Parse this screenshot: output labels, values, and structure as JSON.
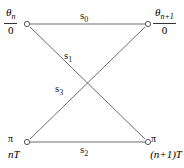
{
  "figure": {
    "type": "trellis-butterfly-diagram",
    "width": 184,
    "height": 168,
    "background_color": "#ffffff",
    "line_color": "#6e6e6e",
    "text_color": "#1a1a1a"
  },
  "nodes": [
    {
      "id": "top-left",
      "x": 27,
      "y": 24,
      "phase_symbol": "θ",
      "phase_subscript": "n",
      "denominator": "0",
      "style": "fraction"
    },
    {
      "id": "top-right",
      "x": 148,
      "y": 24,
      "phase_symbol": "θ",
      "phase_subscript": "n+1",
      "denominator": "0",
      "style": "fraction"
    },
    {
      "id": "bottom-left",
      "x": 27,
      "y": 142,
      "phase_symbol": "π",
      "time_label": "nT",
      "style": "plain"
    },
    {
      "id": "bottom-right",
      "x": 148,
      "y": 142,
      "phase_symbol": "π",
      "time_label": "(n+1)T",
      "style": "plain"
    }
  ],
  "edges": [
    {
      "id": "edge-s0",
      "label_base": "s",
      "label_subscript": "0",
      "from": "top-left",
      "to": "top-right",
      "label_x": 84,
      "label_y": 12
    },
    {
      "id": "edge-s1",
      "label_base": "s",
      "label_subscript": "1",
      "from": "top-left",
      "to": "bottom-right",
      "label_x": 68,
      "label_y": 53
    },
    {
      "id": "edge-s3",
      "label_base": "s",
      "label_subscript": "3",
      "from": "bottom-left",
      "to": "top-right",
      "label_x": 58,
      "label_y": 86
    },
    {
      "id": "edge-s2",
      "label_base": "s",
      "label_subscript": "2",
      "from": "bottom-left",
      "to": "bottom-right",
      "label_x": 84,
      "label_y": 146
    }
  ],
  "corner_labels": {
    "top_left": {
      "numerator_symbol": "θ",
      "numerator_subscript": "n",
      "denominator": "0"
    },
    "top_right": {
      "numerator_symbol": "θ",
      "numerator_subscript": "n+1",
      "denominator": "0"
    },
    "bottom_left": {
      "pi": "π",
      "time": "nT"
    },
    "bottom_right": {
      "pi": "π",
      "time": "(n+1)T"
    }
  },
  "edge_labels": {
    "s0": {
      "base": "s",
      "sub": "0"
    },
    "s1": {
      "base": "s",
      "sub": "1"
    },
    "s2": {
      "base": "s",
      "sub": "2"
    },
    "s3": {
      "base": "s",
      "sub": "3"
    }
  }
}
